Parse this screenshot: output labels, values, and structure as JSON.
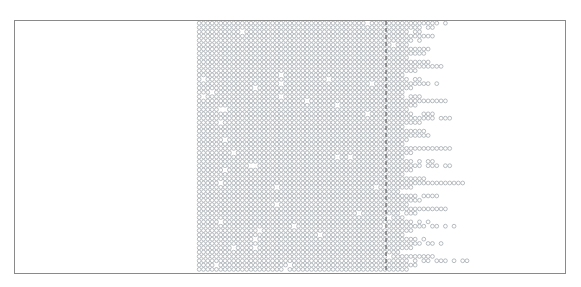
{
  "figure": {
    "kind": "particle-simulation-snapshot",
    "title": "Particle Simulation Snapshot",
    "width": 581,
    "height": 287,
    "background_color": "#ffffff"
  },
  "domain_box": {
    "label": "simulation-domain",
    "x": 14,
    "y": 20,
    "width": 552,
    "height": 254,
    "border_color": "#8a8a8a",
    "border_width": 1,
    "fill": "none"
  },
  "interface_line": {
    "label": "interface-marker",
    "orientation": "vertical",
    "x": 386,
    "y_top": 21,
    "y_bottom": 273,
    "color": "#4a4a4a",
    "width": 1,
    "dash_on": 4,
    "dash_off": 3
  },
  "particles": {
    "glyph": "circle-outline",
    "radius": 1.9,
    "stroke_color": "#9aa0a6",
    "stroke_width": 0.7,
    "fill_color": "#ffffff",
    "spacing_x": 4.32,
    "spacing_y": 4.32,
    "row_stagger": 0.0,
    "count_estimate": 3180
  },
  "bulk_region": {
    "label": "dense-lattice-bulk",
    "x_left": 197,
    "x_right": 400,
    "y_top": 21,
    "y_bottom": 273,
    "description": "regular close-packed lattice of particles filling the right-of-centre portion of the domain"
  },
  "empty_region": {
    "label": "vacuum-region-left",
    "x_left": 15,
    "x_right": 197,
    "y_top": 21,
    "y_bottom": 273,
    "description": "empty (no particles) left third of the domain"
  },
  "spray_region": {
    "label": "jet-spray-right",
    "x_start": 400,
    "x_max": 472,
    "description": "ragged fingers / jets of particles ejecting rightward past the interface line",
    "finger_rows": [
      {
        "y": 24,
        "x_end": 452
      },
      {
        "y": 28,
        "x_end": 433
      },
      {
        "y": 33,
        "x_end": 428
      },
      {
        "y": 37,
        "x_end": 441
      },
      {
        "y": 41,
        "x_end": 420
      },
      {
        "y": 46,
        "x_end": 415
      },
      {
        "y": 50,
        "x_end": 437
      },
      {
        "y": 54,
        "x_end": 424
      },
      {
        "y": 59,
        "x_end": 411
      },
      {
        "y": 63,
        "x_end": 432
      },
      {
        "y": 67,
        "x_end": 446
      },
      {
        "y": 72,
        "x_end": 418
      },
      {
        "y": 76,
        "x_end": 407
      },
      {
        "y": 80,
        "x_end": 429
      },
      {
        "y": 85,
        "x_end": 440
      },
      {
        "y": 89,
        "x_end": 413
      },
      {
        "y": 93,
        "x_end": 404
      },
      {
        "y": 98,
        "x_end": 425
      },
      {
        "y": 102,
        "x_end": 448
      },
      {
        "y": 106,
        "x_end": 416
      },
      {
        "y": 111,
        "x_end": 408
      },
      {
        "y": 115,
        "x_end": 434
      },
      {
        "y": 119,
        "x_end": 456
      },
      {
        "y": 124,
        "x_end": 421
      },
      {
        "y": 128,
        "x_end": 405
      },
      {
        "y": 132,
        "x_end": 430
      },
      {
        "y": 137,
        "x_end": 444
      },
      {
        "y": 141,
        "x_end": 412
      },
      {
        "y": 145,
        "x_end": 403
      },
      {
        "y": 150,
        "x_end": 460
      },
      {
        "y": 154,
        "x_end": 422
      },
      {
        "y": 158,
        "x_end": 409
      },
      {
        "y": 163,
        "x_end": 436
      },
      {
        "y": 167,
        "x_end": 451
      },
      {
        "y": 171,
        "x_end": 414
      },
      {
        "y": 176,
        "x_end": 404
      },
      {
        "y": 180,
        "x_end": 427
      },
      {
        "y": 184,
        "x_end": 465
      },
      {
        "y": 189,
        "x_end": 417
      },
      {
        "y": 193,
        "x_end": 406
      },
      {
        "y": 197,
        "x_end": 438
      },
      {
        "y": 202,
        "x_end": 423
      },
      {
        "y": 206,
        "x_end": 410
      },
      {
        "y": 210,
        "x_end": 447
      },
      {
        "y": 215,
        "x_end": 419
      },
      {
        "y": 219,
        "x_end": 403
      },
      {
        "y": 223,
        "x_end": 431
      },
      {
        "y": 228,
        "x_end": 457
      },
      {
        "y": 232,
        "x_end": 415
      },
      {
        "y": 236,
        "x_end": 405
      },
      {
        "y": 241,
        "x_end": 426
      },
      {
        "y": 245,
        "x_end": 443
      },
      {
        "y": 249,
        "x_end": 412
      },
      {
        "y": 254,
        "x_end": 402
      },
      {
        "y": 258,
        "x_end": 435
      },
      {
        "y": 262,
        "x_end": 468
      },
      {
        "y": 267,
        "x_end": 418
      },
      {
        "y": 271,
        "x_end": 407
      }
    ]
  },
  "chart_data": {
    "type": "scatter",
    "title": "Particle Simulation Snapshot",
    "xlabel": "",
    "ylabel": "",
    "xlim": [
      14,
      566
    ],
    "ylim": [
      20,
      274
    ],
    "grid": false,
    "legend": "none",
    "annotations": [
      "dense particle lattice occupying x 197-400",
      "dashed vertical interface marker at x = 386",
      "ejected spray fingers extending to x = 472"
    ]
  }
}
